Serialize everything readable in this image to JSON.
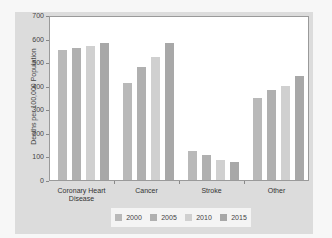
{
  "chart_data": {
    "type": "bar",
    "title": "",
    "xlabel": "",
    "ylabel": "Deaths per 100,000 Population",
    "ylim": [
      0,
      700
    ],
    "yticks": [
      0,
      100,
      200,
      300,
      400,
      500,
      600,
      700
    ],
    "categories": [
      "Coronary Heart Disease",
      "Cancer",
      "Stroke",
      "Other"
    ],
    "series": [
      {
        "name": "2000",
        "color": "#b9b9b9",
        "values": [
          550,
          410,
          125,
          350
        ]
      },
      {
        "name": "2005",
        "color": "#b0b0b0",
        "values": [
          560,
          480,
          105,
          380
        ]
      },
      {
        "name": "2010",
        "color": "#d0d0d0",
        "values": [
          570,
          520,
          85,
          400
        ]
      },
      {
        "name": "2015",
        "color": "#a8a8a8",
        "values": [
          580,
          580,
          75,
          440
        ]
      }
    ],
    "grid": false,
    "legend_position": "bottom"
  },
  "axis": {
    "ylabel": "Deaths per 100,000 Population",
    "yticks": [
      "0",
      "100",
      "200",
      "300",
      "400",
      "500",
      "600",
      "700"
    ],
    "xlabels": [
      {
        "line1": "Coronary Heart",
        "line2": "Disease"
      },
      {
        "line1": "Cancer",
        "line2": ""
      },
      {
        "line1": "Stroke",
        "line2": ""
      },
      {
        "line1": "Other",
        "line2": ""
      }
    ]
  },
  "legend": {
    "items": [
      {
        "label": "2000"
      },
      {
        "label": "2005"
      },
      {
        "label": "2010"
      },
      {
        "label": "2015"
      }
    ]
  }
}
